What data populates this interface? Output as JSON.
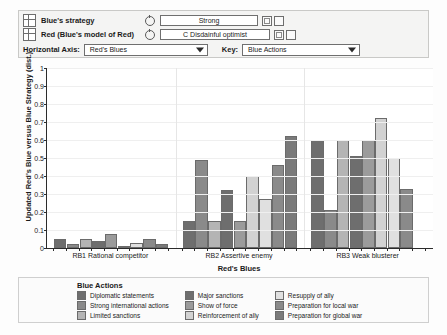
{
  "controls": {
    "blue_strategy": {
      "label": "Blue's strategy",
      "value": "Strong",
      "icon": "grid-icon",
      "spinner_icon": "spinner-icon"
    },
    "red_model": {
      "label": "Red (Blue's model of Red)",
      "value": "C Disdainful optimist",
      "icon": "grid-icon",
      "spinner_icon": "spinner-icon"
    },
    "horizontal_axis": {
      "label": "Horizontal Axis:",
      "value": "Red's Blues"
    },
    "key": {
      "label": "Key:",
      "value": "Blue Actions"
    }
  },
  "legend": {
    "title": "Blue Actions",
    "columns": [
      [
        {
          "label": "Diplomatic statements",
          "color": "#6e6e6e"
        },
        {
          "label": "Strong international actions",
          "color": "#8a8a8a"
        },
        {
          "label": "Limited sanctions",
          "color": "#b4b4b4"
        }
      ],
      [
        {
          "label": "Major sanctions",
          "color": "#6e6e6e"
        },
        {
          "label": "Show of force",
          "color": "#9b9b9b"
        },
        {
          "label": "Reinforcement of ally",
          "color": "#d2d2d2"
        }
      ],
      [
        {
          "label": "Resupply of ally",
          "color": "#e0e0e0"
        },
        {
          "label": "Preparation for local war",
          "color": "#8a8a8a"
        },
        {
          "label": "Preparation for global war",
          "color": "#7a7a7a"
        }
      ]
    ]
  },
  "chart_data": {
    "type": "bar",
    "title": "",
    "xlabel": "Red's Blues",
    "ylabel": "Updated Red's Blue versus Blue Strategy (dist.)",
    "ylim": [
      0,
      1
    ],
    "ytick_labels": [
      "0",
      "0.1",
      "0.2",
      "0.3",
      "0.4",
      "0.5",
      "0.6",
      "0.7",
      "0.8",
      "0.9",
      "1"
    ],
    "ytick_values": [
      0,
      0.1,
      0.2,
      0.3,
      0.4,
      0.5,
      0.6,
      0.7,
      0.8,
      0.9,
      1
    ],
    "grid": true,
    "legend_position": "bottom",
    "categories": [
      "RB1 Rational competitor",
      "RB2 Assertive enemy",
      "RB3 Weak blusterer"
    ],
    "series": [
      {
        "name": "Diplomatic statements",
        "color": "#6e6e6e",
        "values": [
          0.05,
          0.15,
          0.6
        ]
      },
      {
        "name": "Strong international actions",
        "color": "#8a8a8a",
        "values": [
          0.02,
          0.49,
          0.21
        ]
      },
      {
        "name": "Limited sanctions",
        "color": "#b4b4b4",
        "values": [
          0.05,
          0.15,
          0.6
        ]
      },
      {
        "name": "Major sanctions",
        "color": "#6e6e6e",
        "values": [
          0.04,
          0.32,
          0.51
        ]
      },
      {
        "name": "Show of force",
        "color": "#9b9b9b",
        "values": [
          0.08,
          0.15,
          0.6
        ]
      },
      {
        "name": "Reinforcement of ally",
        "color": "#d2d2d2",
        "values": [
          0.01,
          0.4,
          0.72
        ]
      },
      {
        "name": "Resupply of ally",
        "color": "#e0e0e0",
        "values": [
          0.03,
          0.27,
          0.5
        ]
      },
      {
        "name": "Preparation for local war",
        "color": "#8a8a8a",
        "values": [
          0.05,
          0.46,
          0.33
        ]
      },
      {
        "name": "Preparation for global war",
        "color": "#7a7a7a",
        "values": [
          0.02,
          0.62,
          0.0
        ]
      }
    ]
  }
}
